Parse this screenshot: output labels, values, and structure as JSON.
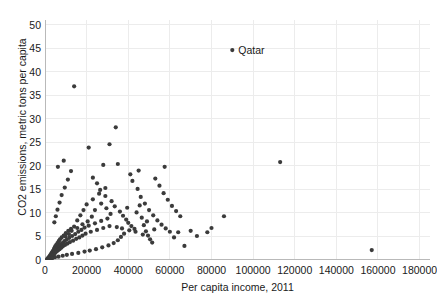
{
  "chart_data": {
    "type": "scatter",
    "title": "",
    "xlabel": "Per capita income, 2011",
    "ylabel": "CO2 emissions, metric tons per capita",
    "xlim": [
      0,
      185000
    ],
    "ylim": [
      0,
      51
    ],
    "xticks": [
      0,
      20000,
      40000,
      60000,
      80000,
      100000,
      120000,
      140000,
      160000,
      180000
    ],
    "xticklabels": [
      "0",
      "20000",
      "40000",
      "60000",
      "80000",
      "100000",
      "120000",
      "140000",
      "160000",
      "180000"
    ],
    "yticks": [
      0,
      5,
      10,
      15,
      20,
      25,
      30,
      35,
      40,
      45,
      50
    ],
    "yticklabels": [
      "0",
      "5",
      "10",
      "15",
      "20",
      "25",
      "30",
      "35",
      "40",
      "45",
      "50"
    ],
    "grid": true,
    "legend": null,
    "marker_color": "#3b3b3b",
    "marker_size": 3.0,
    "annotations": [
      {
        "text": "Qatar",
        "x": 90000,
        "y": 44.6,
        "dx_px": 6,
        "dy_px": -5
      }
    ],
    "points": [
      [
        1000,
        0.2
      ],
      [
        1200,
        0.1
      ],
      [
        1400,
        0.3
      ],
      [
        1500,
        0.2
      ],
      [
        1600,
        0.5
      ],
      [
        1700,
        0.3
      ],
      [
        1800,
        0.4
      ],
      [
        1900,
        0.2
      ],
      [
        2000,
        0.6
      ],
      [
        2100,
        0.3
      ],
      [
        2200,
        0.8
      ],
      [
        2300,
        0.5
      ],
      [
        2400,
        0.4
      ],
      [
        2500,
        1.0
      ],
      [
        2600,
        0.7
      ],
      [
        2700,
        0.6
      ],
      [
        2800,
        1.2
      ],
      [
        2900,
        0.9
      ],
      [
        3000,
        0.5
      ],
      [
        3100,
        1.4
      ],
      [
        3200,
        1.0
      ],
      [
        3300,
        0.8
      ],
      [
        3400,
        1.6
      ],
      [
        3500,
        1.1
      ],
      [
        3600,
        0.9
      ],
      [
        3700,
        1.8
      ],
      [
        3800,
        1.3
      ],
      [
        3900,
        1.0
      ],
      [
        4000,
        2.0
      ],
      [
        4100,
        1.5
      ],
      [
        4200,
        1.2
      ],
      [
        4300,
        2.3
      ],
      [
        4400,
        1.7
      ],
      [
        4500,
        1.4
      ],
      [
        4600,
        2.6
      ],
      [
        4700,
        1.9
      ],
      [
        4800,
        1.5
      ],
      [
        4900,
        2.9
      ],
      [
        5000,
        2.1
      ],
      [
        5200,
        1.7
      ],
      [
        5400,
        3.2
      ],
      [
        5600,
        2.4
      ],
      [
        5800,
        1.9
      ],
      [
        6000,
        3.6
      ],
      [
        6200,
        2.7
      ],
      [
        6400,
        2.1
      ],
      [
        6600,
        4.0
      ],
      [
        6800,
        3.0
      ],
      [
        7000,
        2.3
      ],
      [
        7200,
        4.4
      ],
      [
        7500,
        3.3
      ],
      [
        7800,
        2.6
      ],
      [
        8000,
        4.8
      ],
      [
        8300,
        3.6
      ],
      [
        8600,
        2.9
      ],
      [
        9000,
        5.2
      ],
      [
        9300,
        4.0
      ],
      [
        9600,
        3.2
      ],
      [
        10000,
        5.7
      ],
      [
        10400,
        4.3
      ],
      [
        10800,
        3.5
      ],
      [
        11200,
        6.2
      ],
      [
        11600,
        4.7
      ],
      [
        12000,
        3.8
      ],
      [
        12500,
        6.6
      ],
      [
        13000,
        5.1
      ],
      [
        13500,
        4.1
      ],
      [
        14000,
        7.1
      ],
      [
        14500,
        5.5
      ],
      [
        15000,
        4.5
      ],
      [
        15500,
        8.4
      ],
      [
        16000,
        6.0
      ],
      [
        16500,
        4.8
      ],
      [
        17000,
        9.5
      ],
      [
        17500,
        6.4
      ],
      [
        18000,
        5.2
      ],
      [
        18500,
        10.6
      ],
      [
        19000,
        6.9
      ],
      [
        19500,
        5.6
      ],
      [
        20000,
        11.8
      ],
      [
        21000,
        7.3
      ],
      [
        22000,
        6.0
      ],
      [
        23000,
        12.9
      ],
      [
        24000,
        7.8
      ],
      [
        25000,
        6.4
      ],
      [
        26000,
        14.1
      ],
      [
        27000,
        8.3
      ],
      [
        28000,
        6.8
      ],
      [
        29000,
        15.3
      ],
      [
        30000,
        8.8
      ],
      [
        31000,
        7.2
      ],
      [
        4500,
        8.0
      ],
      [
        5200,
        9.3
      ],
      [
        6000,
        10.7
      ],
      [
        7000,
        12.2
      ],
      [
        8000,
        13.8
      ],
      [
        9500,
        15.4
      ],
      [
        11000,
        17.1
      ],
      [
        12500,
        18.9
      ],
      [
        6200,
        19.8
      ],
      [
        9000,
        21.1
      ],
      [
        14000,
        36.9
      ],
      [
        21000,
        23.9
      ],
      [
        31000,
        24.6
      ],
      [
        34000,
        28.2
      ],
      [
        28000,
        20.2
      ],
      [
        35000,
        20.4
      ],
      [
        113000,
        20.8
      ],
      [
        23000,
        17.5
      ],
      [
        25000,
        16.3
      ],
      [
        26500,
        14.9
      ],
      [
        29000,
        13.6
      ],
      [
        32000,
        12.5
      ],
      [
        33500,
        11.4
      ],
      [
        36000,
        10.3
      ],
      [
        37500,
        9.4
      ],
      [
        39000,
        8.6
      ],
      [
        40000,
        7.9
      ],
      [
        41500,
        7.2
      ],
      [
        43000,
        6.6
      ],
      [
        44000,
        10.1
      ],
      [
        45500,
        11.6
      ],
      [
        46500,
        9.0
      ],
      [
        47500,
        7.4
      ],
      [
        48500,
        6.1
      ],
      [
        49500,
        5.2
      ],
      [
        50500,
        4.4
      ],
      [
        51500,
        3.7
      ],
      [
        38000,
        5.6
      ],
      [
        36500,
        4.9
      ],
      [
        35000,
        4.2
      ],
      [
        33000,
        3.6
      ],
      [
        30500,
        3.1
      ],
      [
        27500,
        2.7
      ],
      [
        24500,
        2.3
      ],
      [
        21500,
        2.0
      ],
      [
        19000,
        1.8
      ],
      [
        16000,
        1.5
      ],
      [
        13000,
        1.3
      ],
      [
        10500,
        1.1
      ],
      [
        8500,
        0.9
      ],
      [
        6500,
        0.7
      ],
      [
        4800,
        0.6
      ],
      [
        3500,
        0.4
      ],
      [
        42000,
        16.8
      ],
      [
        44500,
        15.1
      ],
      [
        46000,
        13.4
      ],
      [
        48000,
        12.0
      ],
      [
        50000,
        10.6
      ],
      [
        52000,
        9.5
      ],
      [
        54000,
        8.4
      ],
      [
        56000,
        7.5
      ],
      [
        58000,
        6.7
      ],
      [
        60000,
        6.0
      ],
      [
        53000,
        17.3
      ],
      [
        55000,
        15.8
      ],
      [
        57000,
        14.2
      ],
      [
        59000,
        12.8
      ],
      [
        61000,
        11.5
      ],
      [
        63000,
        10.4
      ],
      [
        65000,
        9.3
      ],
      [
        67000,
        3.0
      ],
      [
        64000,
        5.9
      ],
      [
        62000,
        4.8
      ],
      [
        57500,
        19.8
      ],
      [
        52500,
        6.5
      ],
      [
        49000,
        8.2
      ],
      [
        47000,
        5.4
      ],
      [
        43500,
        6.0
      ],
      [
        40500,
        6.3
      ],
      [
        37000,
        6.7
      ],
      [
        34500,
        7.0
      ],
      [
        45000,
        19.0
      ],
      [
        41000,
        18.2
      ],
      [
        39500,
        11.1
      ],
      [
        31500,
        9.8
      ],
      [
        29500,
        11.0
      ],
      [
        27000,
        12.0
      ],
      [
        24000,
        10.6
      ],
      [
        22500,
        9.2
      ],
      [
        20500,
        8.2
      ],
      [
        18000,
        7.6
      ],
      [
        15500,
        6.8
      ],
      [
        12800,
        6.2
      ],
      [
        11500,
        5.5
      ],
      [
        9800,
        5.0
      ],
      [
        86000,
        9.3
      ],
      [
        80000,
        6.8
      ],
      [
        78000,
        5.9
      ],
      [
        70000,
        6.2
      ],
      [
        73000,
        5.1
      ],
      [
        157000,
        2.1
      ],
      [
        90000,
        44.6
      ]
    ]
  }
}
